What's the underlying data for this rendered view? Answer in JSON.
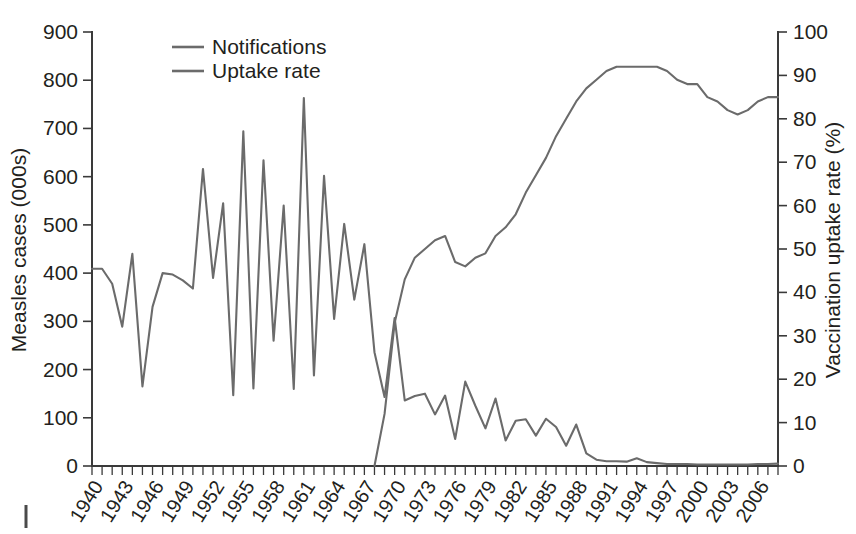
{
  "chart_data": {
    "type": "line",
    "title": "",
    "xlabel": "",
    "ylabel": "Measles cases (000s)",
    "y2label": "Vaccination uptake rate (%)",
    "ylim": [
      0,
      900
    ],
    "y2lim": [
      0,
      100
    ],
    "xlim": [
      1940,
      2008
    ],
    "grid": false,
    "legend_position": "top-left",
    "ytick_labels": [
      "0",
      "100",
      "200",
      "300",
      "400",
      "500",
      "600",
      "700",
      "800",
      "900"
    ],
    "ytick_values": [
      0,
      100,
      200,
      300,
      400,
      500,
      600,
      700,
      800,
      900
    ],
    "y2tick_labels": [
      "0",
      "10",
      "20",
      "30",
      "40",
      "50",
      "60",
      "70",
      "80",
      "90",
      "100"
    ],
    "y2tick_values": [
      0,
      10,
      20,
      30,
      40,
      50,
      60,
      70,
      80,
      90,
      100
    ],
    "xtick_labels": [
      "1940",
      "1943",
      "1946",
      "1949",
      "1952",
      "1955",
      "1958",
      "1961",
      "1964",
      "1967",
      "1970",
      "1973",
      "1976",
      "1979",
      "1982",
      "1985",
      "1988",
      "1991",
      "1994",
      "1997",
      "2000",
      "2003",
      "2006"
    ],
    "xtick_values": [
      1940,
      1943,
      1946,
      1949,
      1952,
      1955,
      1958,
      1961,
      1964,
      1967,
      1970,
      1973,
      1976,
      1979,
      1982,
      1985,
      1988,
      1991,
      1994,
      1997,
      2000,
      2003,
      2006
    ],
    "x": [
      1940,
      1941,
      1942,
      1943,
      1944,
      1945,
      1946,
      1947,
      1948,
      1949,
      1950,
      1951,
      1952,
      1953,
      1954,
      1955,
      1956,
      1957,
      1958,
      1959,
      1960,
      1961,
      1962,
      1963,
      1964,
      1965,
      1966,
      1967,
      1968,
      1969,
      1970,
      1971,
      1972,
      1973,
      1974,
      1975,
      1976,
      1977,
      1978,
      1979,
      1980,
      1981,
      1982,
      1983,
      1984,
      1985,
      1986,
      1987,
      1988,
      1989,
      1990,
      1991,
      1992,
      1993,
      1994,
      1995,
      1996,
      1997,
      1998,
      1999,
      2000,
      2001,
      2002,
      2003,
      2004,
      2005,
      2006,
      2007,
      2008
    ],
    "series": [
      {
        "name": "Notifications",
        "axis": "left",
        "units": "thousands of measles cases",
        "color": "#6b6b6b",
        "values": [
          409,
          409,
          378,
          289,
          440,
          165,
          330,
          400,
          397,
          385,
          368,
          616,
          390,
          545,
          147,
          694,
          161,
          634,
          260,
          540,
          160,
          763,
          188,
          602,
          305,
          502,
          345,
          460,
          236,
          143,
          307,
          136,
          145,
          150,
          107,
          146,
          56,
          175,
          125,
          78,
          140,
          53,
          94,
          97,
          63,
          98,
          81,
          42,
          86,
          26,
          13,
          10,
          10,
          9,
          16,
          8,
          6,
          4,
          4,
          4,
          3,
          3,
          3,
          3,
          3,
          3,
          4,
          4,
          5
        ]
      },
      {
        "name": "Uptake rate",
        "axis": "right",
        "units": "percent vaccination uptake",
        "color": "#6b6b6b",
        "values": [
          null,
          null,
          null,
          null,
          null,
          null,
          null,
          null,
          null,
          null,
          null,
          null,
          null,
          null,
          null,
          null,
          null,
          null,
          null,
          null,
          null,
          null,
          null,
          null,
          null,
          null,
          null,
          null,
          0,
          12,
          33,
          43,
          48,
          50,
          52,
          53,
          47,
          46,
          48,
          49,
          53,
          55,
          58,
          63,
          67,
          71,
          76,
          80,
          84,
          87,
          89,
          91,
          92,
          92,
          92,
          92,
          92,
          91,
          89,
          88,
          88,
          85,
          84,
          82,
          81,
          82,
          84,
          85,
          85
        ]
      }
    ],
    "annotations": []
  },
  "legend": {
    "items": [
      {
        "label": "Notifications",
        "color": "#6b6b6b"
      },
      {
        "label": "Uptake rate",
        "color": "#6b6b6b"
      }
    ]
  }
}
